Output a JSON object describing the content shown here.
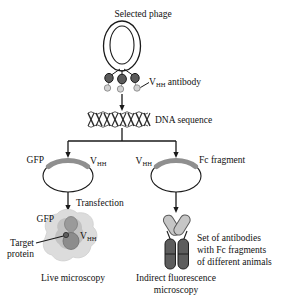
{
  "figure": {
    "title": "Selected phage",
    "colors": {
      "outline": "#1a1a1a",
      "phage_capsid_fill": "#ffffff",
      "vhh_dark_dot": "#4a4a4a",
      "vhh_light_dot": "#c9c9c9",
      "plasmid_insert": "#8f8f8f",
      "cell_cytoplasm": "#d9d9d9",
      "cell_inner": "#b8b8b8",
      "gfp_blob": "#9a9a9a",
      "target_protein": "#7d7d7d",
      "antibody_arm": "#c2c2c2",
      "antibody_fc": "#5d5d5d",
      "dna_strand": "#2b2b2b"
    }
  },
  "steps": {
    "phage": {
      "title": "Selected phage",
      "antibody_label_main": "V",
      "antibody_label_sub": "HH",
      "antibody_label_rest": " antibody"
    },
    "dna": {
      "label": "DNA sequence"
    },
    "left_plasmid": {
      "left_label": "GFP",
      "right_label_main": "V",
      "right_label_sub": "HH",
      "arrow_label": "Transfection"
    },
    "right_plasmid": {
      "left_label_main": "V",
      "left_label_sub": "HH",
      "right_label": "Fc fragment"
    },
    "left_result": {
      "gfp_label": "GFP",
      "vhh_label_main": "V",
      "vhh_label_sub": "HH",
      "target_label_line1": "Target",
      "target_label_line2": "protein",
      "caption": "Live microscopy"
    },
    "right_result": {
      "description_line1": "Set of antibodies",
      "description_line2": "with Fc fragments",
      "description_line3": "of different animals",
      "caption_line1": "Indirect fluorescence",
      "caption_line2": "microscopy"
    }
  }
}
